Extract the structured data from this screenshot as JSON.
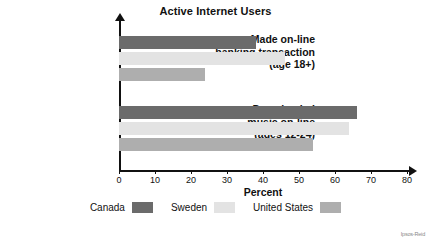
{
  "chart_data": {
    "type": "bar",
    "orientation": "horizontal",
    "title": "Active Internet Users",
    "xlabel": "Percent",
    "ylabel": "",
    "xlim": [
      0,
      80
    ],
    "xticks": [
      0,
      10,
      20,
      30,
      40,
      50,
      60,
      70,
      80
    ],
    "grid": false,
    "legend_position": "bottom",
    "categories": [
      "Made on-line banking transaction (age 18+)",
      "Downloaded music on-line (ages 12-24)"
    ],
    "category_lines": [
      [
        "Made on-line",
        "banking transaction",
        "(age 18+)"
      ],
      [
        "Downloaded",
        "music on-line",
        "(ages 12-24)"
      ]
    ],
    "series": [
      {
        "name": "Canada",
        "color": "#6b6b6b",
        "values": [
          38,
          66
        ]
      },
      {
        "name": "Sweden",
        "color": "#e3e3e3",
        "values": [
          46,
          64
        ]
      },
      {
        "name": "United States",
        "color": "#aeaeae",
        "values": [
          24,
          54
        ]
      }
    ]
  },
  "legend": {
    "entries": [
      {
        "label": "Canada",
        "color": "#6b6b6b"
      },
      {
        "label": "Sweden",
        "color": "#e3e3e3"
      },
      {
        "label": "United States",
        "color": "#aeaeae"
      }
    ]
  },
  "axis": {
    "x_title": "Percent",
    "tick_labels": [
      "0",
      "10",
      "20",
      "30",
      "40",
      "50",
      "60",
      "70",
      "80"
    ]
  },
  "watermark": {
    "text": "Ipsos-Reid"
  }
}
